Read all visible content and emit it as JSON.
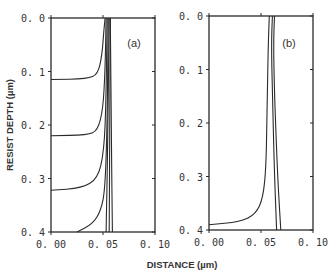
{
  "chart_data": [
    {
      "type": "line",
      "panel": "(a)",
      "xlabel": "DISTANCE (µm)",
      "ylabel": "RESIST DEPTH (µm)",
      "xlim": [
        0.0,
        0.1
      ],
      "ylim": [
        0.4,
        0.0
      ],
      "xticks": [
        "0.00",
        "0.05",
        "0.10"
      ],
      "yticks": [
        "0.0",
        "0.1",
        "0.2",
        "0.3",
        "0.4"
      ],
      "grid": false,
      "series": [
        {
          "name": "profile-1",
          "points": [
            [
              0.0,
              0.115
            ],
            [
              0.035,
              0.114
            ],
            [
              0.045,
              0.105
            ],
            [
              0.049,
              0.07
            ],
            [
              0.051,
              0.02
            ],
            [
              0.052,
              0.0
            ]
          ]
        },
        {
          "name": "profile-2",
          "points": [
            [
              0.0,
              0.22
            ],
            [
              0.035,
              0.219
            ],
            [
              0.045,
              0.21
            ],
            [
              0.05,
              0.17
            ],
            [
              0.052,
              0.1
            ],
            [
              0.053,
              0.0
            ]
          ]
        },
        {
          "name": "profile-3",
          "points": [
            [
              0.0,
              0.322
            ],
            [
              0.03,
              0.318
            ],
            [
              0.045,
              0.3
            ],
            [
              0.051,
              0.25
            ],
            [
              0.053,
              0.15
            ],
            [
              0.054,
              0.0
            ]
          ]
        },
        {
          "name": "profile-4",
          "points": [
            [
              0.025,
              0.4
            ],
            [
              0.04,
              0.385
            ],
            [
              0.048,
              0.36
            ],
            [
              0.052,
              0.32
            ],
            [
              0.054,
              0.2
            ],
            [
              0.055,
              0.0
            ]
          ]
        },
        {
          "name": "profile-5",
          "points": [
            [
              0.053,
              0.4
            ],
            [
              0.054,
              0.3
            ],
            [
              0.055,
              0.15
            ],
            [
              0.056,
              0.0
            ]
          ]
        },
        {
          "name": "profile-6",
          "points": [
            [
              0.056,
              0.4
            ],
            [
              0.0565,
              0.2
            ],
            [
              0.057,
              0.0
            ]
          ]
        },
        {
          "name": "profile-7",
          "points": [
            [
              0.059,
              0.4
            ],
            [
              0.058,
              0.2
            ],
            [
              0.057,
              0.0
            ]
          ]
        }
      ]
    },
    {
      "type": "line",
      "panel": "(b)",
      "xlabel": "DISTANCE (µm)",
      "ylabel": "RESIST DEPTH (µm)",
      "xlim": [
        0.0,
        0.1
      ],
      "ylim": [
        0.4,
        0.0
      ],
      "xticks": [
        "0.00",
        "0.05",
        "0.10"
      ],
      "yticks": [
        "0.0",
        "0.1",
        "0.2",
        "0.3",
        "0.4"
      ],
      "grid": false,
      "series": [
        {
          "name": "profile-1",
          "points": [
            [
              0.0,
              0.39
            ],
            [
              0.03,
              0.385
            ],
            [
              0.045,
              0.37
            ],
            [
              0.052,
              0.34
            ],
            [
              0.055,
              0.28
            ],
            [
              0.056,
              0.15
            ],
            [
              0.057,
              0.05
            ],
            [
              0.058,
              0.0
            ]
          ]
        },
        {
          "name": "profile-2",
          "points": [
            [
              0.065,
              0.4
            ],
            [
              0.063,
              0.3
            ],
            [
              0.061,
              0.15
            ],
            [
              0.06,
              0.05
            ],
            [
              0.061,
              0.0
            ]
          ]
        },
        {
          "name": "profile-3",
          "points": [
            [
              0.069,
              0.4
            ],
            [
              0.066,
              0.3
            ],
            [
              0.063,
              0.15
            ],
            [
              0.062,
              0.05
            ],
            [
              0.063,
              0.0
            ]
          ]
        }
      ]
    }
  ],
  "labels": {
    "ylabel": "RESIST DEPTH (µm)",
    "xlabel": "DISTANCE (µm)",
    "panel_a": "(a)",
    "panel_b": "(b)",
    "xticks": [
      "0.00",
      "0.05",
      "0.10"
    ],
    "yticks": [
      "0.0",
      "0.1",
      "0.2",
      "0.3",
      "0.4"
    ]
  },
  "style": {
    "line_color": "#2a2a2a",
    "background": "#ffffff"
  }
}
